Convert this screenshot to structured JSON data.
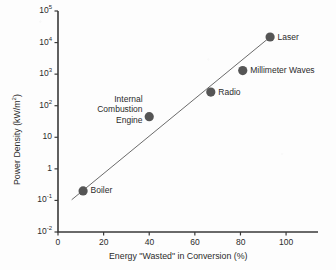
{
  "chart_data": {
    "type": "scatter",
    "title": "",
    "xlabel": "Energy \"Wasted\" in Conversion (%)",
    "ylabel_text": "Power Density (kW/m",
    "ylabel_sup": "2",
    "ylabel_tail": ")",
    "xlim": [
      0,
      114
    ],
    "ylim": [
      0.01,
      100000
    ],
    "yscale": "log",
    "xscale": "linear",
    "grid": false,
    "legend": "none",
    "xticks": [
      {
        "value": 0,
        "label": "0"
      },
      {
        "value": 20,
        "label": "20"
      },
      {
        "value": 40,
        "label": "40"
      },
      {
        "value": 60,
        "label": "60"
      },
      {
        "value": 80,
        "label": "80"
      },
      {
        "value": 100,
        "label": "100"
      }
    ],
    "yticks": [
      {
        "value": 100000,
        "mantissa": "10",
        "exponent": "5"
      },
      {
        "value": 10000,
        "mantissa": "10",
        "exponent": "4"
      },
      {
        "value": 1000,
        "mantissa": "10",
        "exponent": "3"
      },
      {
        "value": 100,
        "mantissa": "10",
        "exponent": "2"
      },
      {
        "value": 10,
        "mantissa": "10",
        "exponent": ""
      },
      {
        "value": 1,
        "mantissa": "1",
        "exponent": ""
      },
      {
        "value": 0.1,
        "mantissa": "10",
        "exponent": "-1"
      },
      {
        "value": 0.01,
        "mantissa": "10",
        "exponent": "-2"
      }
    ],
    "points": [
      {
        "name": "Boiler",
        "label": "Boiler",
        "x": 11,
        "y": 0.2,
        "label_pos": "right"
      },
      {
        "name": "Internal Combustion Engine",
        "label": "Internal\nCombustion\nEngine",
        "x": 40,
        "y": 45,
        "label_pos": "left-multiline"
      },
      {
        "name": "Radio",
        "label": "Radio",
        "x": 67,
        "y": 270,
        "label_pos": "right"
      },
      {
        "name": "Millimeter Waves",
        "label": "Millimeter Waves",
        "x": 81,
        "y": 1300,
        "label_pos": "right"
      },
      {
        "name": "Laser",
        "label": "Laser",
        "x": 93,
        "y": 15000,
        "label_pos": "right"
      }
    ],
    "trendline": {
      "x0": 6,
      "y0": 0.105,
      "x1": 93,
      "y1": 15000
    },
    "marker_color": "#555555",
    "line_color": "#6b6b6b",
    "axis_color": "#3a3a3a",
    "text_color": "#2b2b2b",
    "background_color": "#fdfdfd"
  }
}
